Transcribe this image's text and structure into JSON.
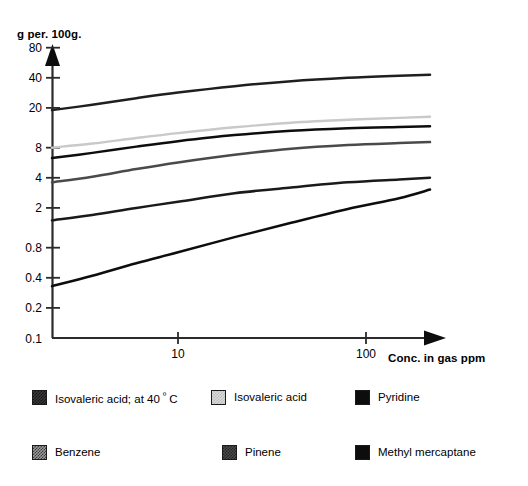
{
  "chart_data": {
    "type": "line",
    "title": "",
    "ylabel": "g per. 100g.",
    "xlabel": "Conc. in gas ppm",
    "xscale": "log",
    "yscale": "log",
    "xlim": [
      2.0,
      280
    ],
    "ylim": [
      0.1,
      100
    ],
    "xticks": [
      10,
      100
    ],
    "xtick_labels": [
      "10",
      "100"
    ],
    "yticks": [
      0.1,
      0.2,
      0.4,
      0.8,
      2,
      4,
      8,
      20,
      40,
      80
    ],
    "ytick_labels": [
      "0.1",
      "0.2",
      "0.4",
      "0.8",
      "2",
      "4",
      "8",
      "20",
      "40",
      "80"
    ],
    "grid": false,
    "legend_position": "below",
    "series": [
      {
        "name": "Isovaleric acid; at 40 º C",
        "color": "#1f1f1f",
        "style": "dark-textured",
        "x": [
          2.0,
          3.5,
          6,
          10,
          20,
          40,
          80,
          150,
          280
        ],
        "y": [
          19.0,
          21.5,
          25.0,
          28.5,
          33.0,
          37.0,
          40.0,
          42.0,
          43.0
        ]
      },
      {
        "name": "Isovaleric acid",
        "color": "#c9c9c9",
        "style": "light-gray",
        "x": [
          2.0,
          3.5,
          6,
          10,
          20,
          40,
          80,
          150,
          280
        ],
        "y": [
          8.0,
          8.8,
          10.0,
          11.2,
          12.8,
          14.2,
          15.2,
          15.9,
          16.3
        ]
      },
      {
        "name": "Pyridine",
        "color": "#0d0d0d",
        "style": "black",
        "x": [
          2.0,
          3.5,
          6,
          10,
          20,
          40,
          80,
          150,
          280
        ],
        "y": [
          6.3,
          7.1,
          8.2,
          9.3,
          10.7,
          11.8,
          12.5,
          12.9,
          13.1
        ]
      },
      {
        "name": "Benzene",
        "color": "#4a4a4a",
        "style": "dark-gray",
        "x": [
          2.0,
          3.5,
          6,
          10,
          20,
          40,
          80,
          150,
          280
        ],
        "y": [
          3.6,
          4.1,
          4.9,
          5.7,
          6.8,
          7.8,
          8.5,
          8.9,
          9.1
        ]
      },
      {
        "name": "Pinene",
        "color": "#1a1a1a",
        "style": "medium-gray",
        "x": [
          2.0,
          3.5,
          6,
          10,
          20,
          40,
          80,
          150,
          280
        ],
        "y": [
          1.5,
          1.7,
          2.0,
          2.3,
          2.8,
          3.2,
          3.6,
          3.85,
          4.0
        ]
      },
      {
        "name": "Methyl mercaptane",
        "color": "#0d0d0d",
        "style": "black",
        "x": [
          2.0,
          3.5,
          6,
          10,
          20,
          40,
          80,
          150,
          280
        ],
        "y": [
          0.33,
          0.42,
          0.56,
          0.72,
          1.02,
          1.42,
          1.95,
          2.5,
          3.05
        ]
      }
    ]
  },
  "axes": {
    "y_axis_title": "g per. 100g.",
    "x_axis_title": "Conc. in gas ppm",
    "y_tick_labels": [
      "80",
      "40",
      "20",
      "8",
      "4",
      "2",
      "0.8",
      "0.4",
      "0.2",
      "0.1"
    ],
    "x_tick_labels": [
      "10",
      "100"
    ]
  },
  "legend": {
    "row1": [
      {
        "label_prefix": "Isovaleric acid; at 40 ",
        "label_sup": "º",
        "label_suffix": " C",
        "swatch": "dark-textured"
      },
      {
        "label": "Isovaleric acid",
        "swatch": "light-gray"
      },
      {
        "label": "Pyridine",
        "swatch": "black"
      }
    ],
    "row2": [
      {
        "label": "Benzene",
        "swatch": "medium-textured"
      },
      {
        "label": "Pinene",
        "swatch": "dark-gray"
      },
      {
        "label": "Methyl mercaptane",
        "swatch": "black"
      }
    ]
  }
}
